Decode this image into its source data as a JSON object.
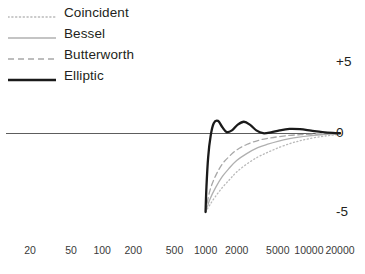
{
  "legend": {
    "position": "top-left",
    "items": [
      {
        "label": "Coincident",
        "style": "dotted",
        "color": "#b9b9b9",
        "width": 1.2,
        "icon": "legend-line-dotted-icon"
      },
      {
        "label": "Bessel",
        "style": "solid",
        "color": "#b0b0b0",
        "width": 1.2,
        "icon": "legend-line-solid-light-icon"
      },
      {
        "label": "Butterworth",
        "style": "dashed",
        "color": "#a8a8a8",
        "width": 1.3,
        "icon": "legend-line-dashed-icon"
      },
      {
        "label": "Elliptic",
        "style": "solid",
        "color": "#1a1a1a",
        "width": 2.2,
        "icon": "legend-line-solid-dark-icon"
      }
    ]
  },
  "axes": {
    "y_labels": {
      "top": "+5",
      "middle": "0",
      "bottom": "-5"
    },
    "x_labels": [
      "20",
      "50",
      "100",
      "200",
      "500",
      "1000",
      "2000",
      "5000",
      "10000",
      "20000"
    ]
  },
  "chart_data": {
    "type": "line",
    "title": "",
    "subtitle": "",
    "xlabel": "",
    "ylabel": "",
    "xscale": "log",
    "xlim": [
      20,
      20000
    ],
    "ylim": [
      -5,
      5
    ],
    "yticks": [
      -5,
      0,
      5
    ],
    "ytick_labels": [
      "-5",
      "0",
      "+5"
    ],
    "xticks": [
      20,
      50,
      100,
      200,
      500,
      1000,
      2000,
      5000,
      10000,
      20000
    ],
    "xtick_labels": [
      "20",
      "50",
      "100",
      "200",
      "500",
      "1000",
      "2000",
      "5000",
      "10000",
      "20000"
    ],
    "grid": false,
    "zero_line": true,
    "legend_entries": [
      "Coincident",
      "Bessel",
      "Butterworth",
      "Elliptic"
    ],
    "series": [
      {
        "name": "Coincident",
        "style": "dotted",
        "color": "#b9b9b9",
        "x": [
          1000,
          1100,
          1250,
          1450,
          1700,
          2000,
          2500,
          3200,
          4000,
          5000,
          6500,
          8000,
          10000,
          13000,
          16000,
          20000
        ],
        "values": [
          -5.0,
          -4.55,
          -4.0,
          -3.45,
          -2.95,
          -2.45,
          -1.95,
          -1.5,
          -1.2,
          -0.92,
          -0.65,
          -0.48,
          -0.33,
          -0.2,
          -0.12,
          -0.05
        ]
      },
      {
        "name": "Bessel",
        "style": "solid",
        "color": "#b0b0b0",
        "x": [
          1000,
          1100,
          1250,
          1450,
          1700,
          2000,
          2500,
          3200,
          4000,
          5000,
          6500,
          8000,
          10000,
          13000,
          16000,
          20000
        ],
        "values": [
          -5.0,
          -4.2,
          -3.45,
          -2.75,
          -2.2,
          -1.72,
          -1.28,
          -0.9,
          -0.68,
          -0.5,
          -0.33,
          -0.23,
          -0.15,
          -0.08,
          -0.04,
          -0.01
        ]
      },
      {
        "name": "Butterworth",
        "style": "dashed",
        "color": "#a8a8a8",
        "x": [
          1000,
          1100,
          1250,
          1450,
          1700,
          2000,
          2500,
          3200,
          4000,
          5000,
          6500,
          8000,
          10000,
          13000,
          16000,
          20000
        ],
        "values": [
          -5.0,
          -3.65,
          -2.7,
          -1.95,
          -1.45,
          -1.05,
          -0.7,
          -0.45,
          -0.31,
          -0.21,
          -0.12,
          -0.08,
          -0.05,
          -0.02,
          -0.01,
          0.0
        ]
      },
      {
        "name": "Elliptic",
        "style": "solid",
        "color": "#1a1a1a",
        "x": [
          1000,
          1020,
          1060,
          1120,
          1200,
          1320,
          1450,
          1600,
          1800,
          2050,
          2350,
          2700,
          3100,
          3600,
          4300,
          5200,
          6500,
          8200,
          10500,
          13500,
          17000,
          20000
        ],
        "values": [
          -5.0,
          -3.4,
          -1.5,
          -0.15,
          0.72,
          0.88,
          0.45,
          0.1,
          0.22,
          0.62,
          0.82,
          0.6,
          0.22,
          0.02,
          0.08,
          0.22,
          0.32,
          0.3,
          0.2,
          0.1,
          0.04,
          0.02
        ]
      }
    ]
  }
}
